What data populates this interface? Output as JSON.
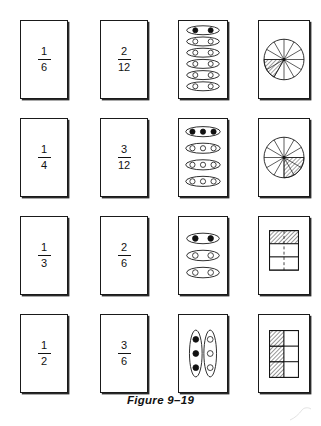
{
  "figure": {
    "caption": "Figure 9–19",
    "ink_color": "#111111",
    "background": "#ffffff"
  },
  "rows": [
    {
      "id": "row-1",
      "fraction_a": {
        "numerator": "1",
        "denominator": "6"
      },
      "fraction_b": {
        "numerator": "2",
        "denominator": "12"
      },
      "set_model": {
        "type": "ellipse-groups",
        "orientation": "horizontal",
        "groups": 6,
        "per_group": 2,
        "total": 12,
        "filled": 2,
        "filled_description": "top group of 2 filled"
      },
      "region_model": {
        "type": "circle-sectors",
        "sectors": 12,
        "shaded": 2,
        "shaded_description": "2 adjacent sectors hatched in lower-left"
      }
    },
    {
      "id": "row-2",
      "fraction_a": {
        "numerator": "1",
        "denominator": "4"
      },
      "fraction_b": {
        "numerator": "3",
        "denominator": "12"
      },
      "set_model": {
        "type": "ellipse-groups",
        "orientation": "horizontal",
        "groups": 4,
        "per_group": 3,
        "total": 12,
        "filled": 3,
        "filled_description": "top group of 3 filled"
      },
      "region_model": {
        "type": "circle-sectors",
        "sectors": 12,
        "shaded": 3,
        "shaded_description": "3 adjacent sectors hatched in lower-right"
      }
    },
    {
      "id": "row-3",
      "fraction_a": {
        "numerator": "1",
        "denominator": "3"
      },
      "fraction_b": {
        "numerator": "2",
        "denominator": "6"
      },
      "set_model": {
        "type": "ellipse-groups",
        "orientation": "horizontal",
        "groups": 3,
        "per_group": 2,
        "total": 6,
        "filled": 2,
        "filled_description": "top group of 2 filled"
      },
      "region_model": {
        "type": "rectangle-grid",
        "rows": 3,
        "columns": 2,
        "total": 6,
        "shaded": 2,
        "shaded_description": "entire top row hatched, dashed vertical midline",
        "divider": "dashed-vertical"
      }
    },
    {
      "id": "row-4",
      "fraction_a": {
        "numerator": "1",
        "denominator": "2"
      },
      "fraction_b": {
        "numerator": "3",
        "denominator": "6"
      },
      "set_model": {
        "type": "ellipse-groups",
        "orientation": "vertical",
        "groups": 2,
        "per_group": 3,
        "total": 6,
        "filled": 3,
        "filled_description": "left group of 3 filled"
      },
      "region_model": {
        "type": "rectangle-grid",
        "rows": 3,
        "columns": 2,
        "total": 6,
        "shaded": 3,
        "shaded_description": "entire left column hatched",
        "divider": "solid"
      }
    }
  ]
}
